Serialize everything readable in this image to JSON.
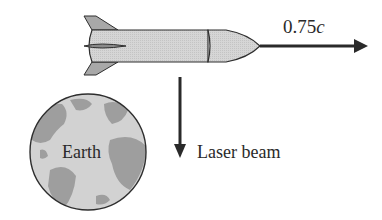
{
  "figure": {
    "type": "physics-diagram",
    "objects": {
      "rocket": {
        "label": "",
        "direction": "right"
      },
      "earth": {
        "label": "Earth"
      },
      "velocity_arrow": {
        "value": "0.75",
        "unit": "c"
      },
      "laser_arrow": {
        "label": "Laser beam",
        "direction": "down"
      }
    }
  },
  "colors": {
    "outline": "#2e2e2e",
    "rocket_body": "#d4d4d4",
    "rocket_fins": "#a8a8a8",
    "earth_ocean": "#cfcfcf",
    "earth_land": "#9a9a9a",
    "arrow": "#2a2a2a",
    "background": "#ffffff"
  }
}
